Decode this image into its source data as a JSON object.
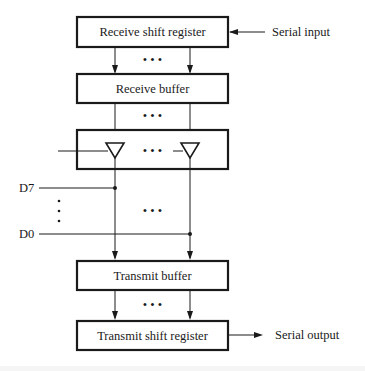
{
  "diagram": {
    "blocks": {
      "receive_shift_register": "Receive shift register",
      "receive_buffer": "Receive buffer",
      "transmit_buffer": "Transmit buffer",
      "transmit_shift_register": "Transmit shift register"
    },
    "io": {
      "serial_input": "Serial input",
      "serial_output": "Serial output"
    },
    "bus_lines": {
      "top": "D7",
      "bottom": "D0"
    },
    "ellipsis": "• • •",
    "vertical_ellipsis": "⋮"
  },
  "colors": {
    "ink": "#1a1a1a",
    "background": "#ffffff"
  }
}
